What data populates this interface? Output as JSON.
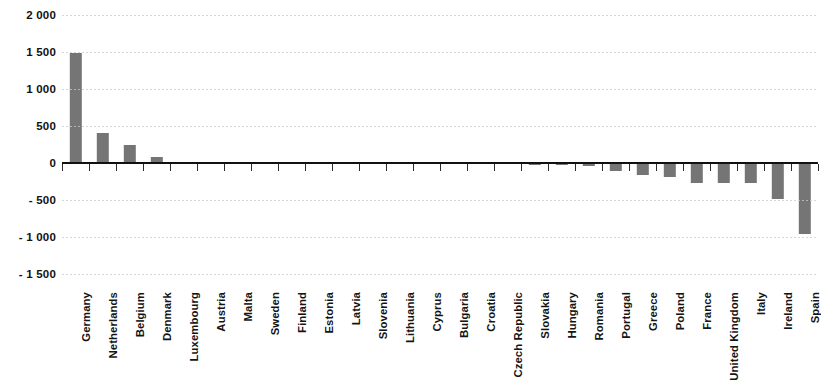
{
  "chart_data": {
    "type": "bar",
    "title": "",
    "subtitle": "",
    "xlabel": "",
    "ylabel": "",
    "ylim": [
      -1500,
      2000
    ],
    "ytick_values": [
      2000,
      1500,
      1000,
      500,
      0,
      -500,
      -1000,
      -1500
    ],
    "ytick_labels": [
      "2 000",
      "1 500",
      "1 000",
      "500",
      "0",
      "- 500",
      "- 1 000",
      "- 1 500"
    ],
    "grid": true,
    "legend": "none",
    "bar_color": "#757575",
    "axis_color": "#111111",
    "gridline_color": "#c9c9c9",
    "categories": [
      "Germany",
      "Netherlands",
      "Belgium",
      "Denmark",
      "Luxembourg",
      "Austria",
      "Malta",
      "Sweden",
      "Finland",
      "Estonia",
      "Latvia",
      "Slovenia",
      "Lithuania",
      "Cyprus",
      "Bulgaria",
      "Croatia",
      "Czech Republic",
      "Slovakia",
      "Hungary",
      "Romania",
      "Portugal",
      "Greece",
      "Poland",
      "France",
      "United Kingdom",
      "Italy",
      "Ireland",
      "Spain"
    ],
    "values": [
      1490,
      400,
      240,
      85,
      10,
      6,
      4,
      3,
      2,
      1,
      -2,
      -3,
      -5,
      -6,
      -8,
      -10,
      -20,
      -22,
      -30,
      -38,
      -110,
      -160,
      -185,
      -265,
      -270,
      -270,
      -490,
      -965
    ]
  }
}
